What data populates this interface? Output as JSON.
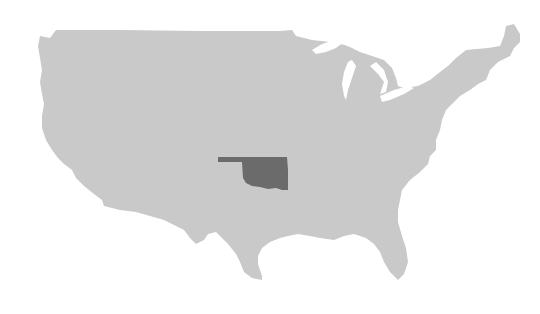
{
  "map": {
    "region": "Contiguous United States",
    "highlighted_state": "Oklahoma",
    "colors": {
      "land": "#c9c9c9",
      "highlight": "#6b6b6b",
      "background": "#ffffff"
    }
  }
}
